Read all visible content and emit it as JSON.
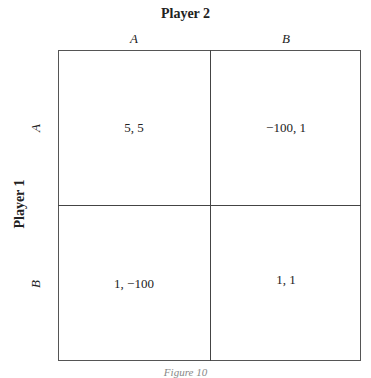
{
  "figure": {
    "column_player": "Player 2",
    "row_player": "Player 1",
    "column_strategies": [
      "A",
      "B"
    ],
    "row_strategies": [
      "A",
      "B"
    ],
    "payoffs": [
      [
        "5, 5",
        "−100, 1"
      ],
      [
        "1, −100",
        "1, 1"
      ]
    ],
    "caption": "Figure 10"
  }
}
